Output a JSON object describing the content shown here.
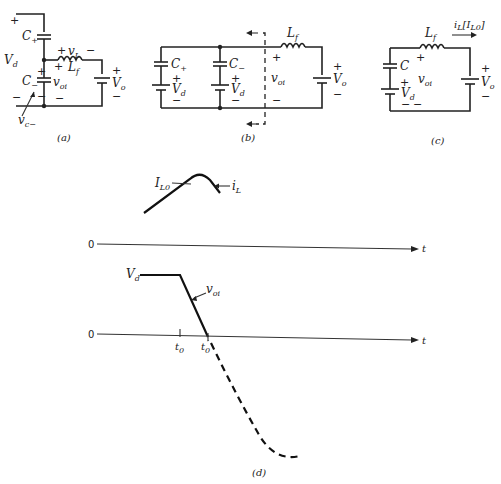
{
  "figure": {
    "panel_a": {
      "caption": "(a)",
      "labels": {
        "c_plus": "C",
        "c_plus_sub": "+",
        "c_minus": "C",
        "c_minus_sub": "−",
        "vd": "V",
        "vd_sub": "d",
        "vL": "v",
        "vL_sub": "L",
        "Lf": "L",
        "Lf_sub": "f",
        "voi": "v",
        "voi_sub": "oi",
        "vo": "V",
        "vo_sub": "o",
        "vc_minus": "v",
        "vc_minus_sub": "c−"
      },
      "signs": {
        "plus": "+",
        "minus": "−"
      }
    },
    "panel_b": {
      "caption": "(b)",
      "labels": {
        "c_plus": "C",
        "c_plus_sub": "+",
        "c_minus": "C",
        "c_minus_sub": "−",
        "vd": "V",
        "vd_sub": "d",
        "Lf": "L",
        "Lf_sub": "f",
        "voi": "v",
        "voi_sub": "oi",
        "vo": "V",
        "vo_sub": "o"
      },
      "signs": {
        "plus": "+",
        "minus": "−"
      }
    },
    "panel_c": {
      "caption": "(c)",
      "labels": {
        "c": "C",
        "vd": "V",
        "vd_sub": "d",
        "Lf": "L",
        "Lf_sub": "f",
        "voi": "v",
        "voi_sub": "oi",
        "vo": "V",
        "vo_sub": "o",
        "iL": "i",
        "iL_sub": "L",
        "iL0": "[I",
        "iL0_sub": "L0",
        "iL0_close": "]"
      },
      "signs": {
        "plus": "+",
        "minus": "−"
      }
    },
    "panel_d": {
      "caption": "(d)",
      "waveform_iL": {
        "IL0": "I",
        "IL0_sub": "L0",
        "iL": "i",
        "iL_sub": "L",
        "zero": "0",
        "t": "t"
      },
      "waveform_voi": {
        "Vd": "V",
        "Vd_sub": "d",
        "voi": "v",
        "voi_sub": "oi",
        "zero": "0",
        "t": "t",
        "t0": "t",
        "t0_sub": "0",
        "t0p": "t",
        "t0p_sub": "0",
        "t0p_prime": "′"
      }
    }
  }
}
